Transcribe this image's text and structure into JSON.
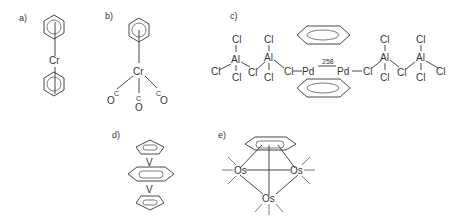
{
  "panels": {
    "a": {
      "label": "a)",
      "metal": "Cr"
    },
    "b": {
      "label": "b)",
      "metal": "Cr",
      "ligands": [
        "OC",
        "C",
        "O",
        "C",
        "O"
      ]
    },
    "c": {
      "label": "c)",
      "pd": "Pd",
      "bond_length": "258",
      "al": "Al",
      "cl": "Cl"
    },
    "d": {
      "label": "d)",
      "v": "V"
    },
    "e": {
      "label": "e)",
      "os": "Os"
    }
  }
}
